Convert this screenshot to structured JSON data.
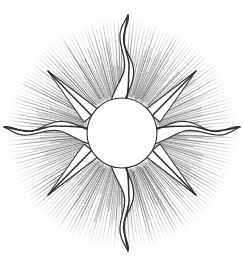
{
  "artwork": {
    "title": "Sunburst",
    "subject": "sun-with-rays",
    "style": "vintage line engraving",
    "technique": "radial hatching with stipple",
    "medium": "pen and ink engraving reproduction",
    "orientation": "upright",
    "background_color": "#ffffff",
    "ink_color": "#4a4a4a",
    "ink_color_dark": "#3a3734",
    "ink_color_light": "#8d8d8d",
    "outline_color": "#2f2c2a",
    "canvas": {
      "width": 244,
      "height": 264
    }
  },
  "composition": {
    "center_x": 122,
    "center_y": 133,
    "disc": {
      "label": "solar disc",
      "radius": 35,
      "fill": "#ffffff",
      "stroke": "#35312e",
      "stroke_width": 1.1,
      "description": "blank white circular face at the core"
    },
    "halo": {
      "label": "radiant halo",
      "inner_radius": 36,
      "outer_radius": 115,
      "ray_count": 180,
      "description": "dense fine radial hatch lines fading outward"
    },
    "major_rays": {
      "count": 8,
      "wavy_count": 4,
      "straight_count": 4,
      "wavy_length": 120,
      "straight_length": 78,
      "description": "four undulating flame rays on the cardinal axes alternating with four straight tapered rays on the diagonals"
    }
  },
  "rays": [
    {
      "name": "ray-north",
      "type": "wavy",
      "angle": 270,
      "length": 120
    },
    {
      "name": "ray-northeast",
      "type": "straight",
      "angle": 315,
      "length": 78
    },
    {
      "name": "ray-east",
      "type": "wavy",
      "angle": 0,
      "length": 112
    },
    {
      "name": "ray-southeast",
      "type": "straight",
      "angle": 45,
      "length": 78
    },
    {
      "name": "ray-south",
      "type": "wavy",
      "angle": 90,
      "length": 120
    },
    {
      "name": "ray-southwest",
      "type": "straight",
      "angle": 135,
      "length": 78
    },
    {
      "name": "ray-west",
      "type": "wavy",
      "angle": 180,
      "length": 112
    },
    {
      "name": "ray-northwest",
      "type": "straight",
      "angle": 225,
      "length": 78
    }
  ]
}
